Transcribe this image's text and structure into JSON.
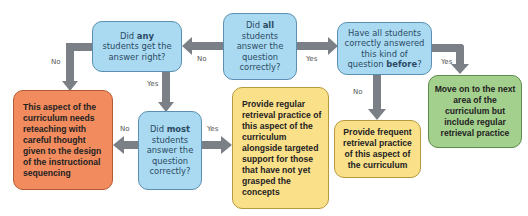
{
  "diagram": {
    "nodes": {
      "q_all": {
        "pre": "Did ",
        "bold": "all",
        "post": " students answer the question correctly?"
      },
      "q_any": {
        "pre": "Did ",
        "bold": "any",
        "post": " students get the answer right?"
      },
      "q_before": {
        "pre": "Have all students correctly answered this kind of question ",
        "bold": "before",
        "post": "?"
      },
      "q_most": {
        "pre": "Did ",
        "bold": "most",
        "post": " students answer the question correctly?"
      },
      "reteach": "This aspect of the curriculum needs reteaching with careful thought given to the design of the instructional sequencing",
      "regular_targeted": "Provide regular retrieval practice of this aspect of the curriculum alongside targeted support for those that have not yet grasped the concepts",
      "frequent": "Provide frequent retrieval practice of this aspect of the curriculum",
      "move_on": "Move on to the next area of the curriculum but include regular retrieval practice"
    },
    "edge_labels": {
      "all_no": "No",
      "all_yes": "Yes",
      "any_no": "No",
      "any_yes": "Yes",
      "before_yes": "Yes",
      "before_no": "No",
      "most_no": "No",
      "most_yes": "Yes"
    },
    "colors": {
      "question": "#a9daf2",
      "reteach": "#f28b5e",
      "retrieval": "#fbe08a",
      "move_on": "#a4d08e",
      "arrow": "#7b7f86"
    }
  }
}
